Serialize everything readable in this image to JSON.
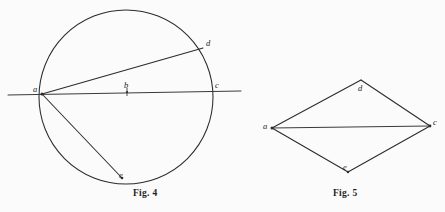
{
  "page": {
    "background_color": "#fbfbfb",
    "ink_color": "#2b2b2b",
    "width": 445,
    "height": 212
  },
  "figures": [
    {
      "id": "fig-4",
      "caption": "Fig. 4",
      "caption_pos": {
        "x": 133,
        "y": 189
      },
      "type": "circle-with-secant-and-chords",
      "circle": {
        "cx": 126,
        "cy": 97,
        "r": 87
      },
      "secant_line": {
        "x1": 8,
        "y1": 95,
        "x2": 241,
        "y2": 91
      },
      "chords": [
        {
          "from": "a",
          "to": "d"
        },
        {
          "from": "a",
          "to": "e"
        }
      ],
      "points": [
        {
          "name": "a",
          "x": 42,
          "y": 94,
          "label": "a",
          "label_x": 33,
          "label_y": 85,
          "dot": true
        },
        {
          "name": "b",
          "x": 127,
          "y": 92,
          "label": "b",
          "label_x": 124,
          "label_y": 81,
          "dot": true,
          "tick": true
        },
        {
          "name": "c",
          "x": 212,
          "y": 92,
          "label": "c",
          "label_x": 215,
          "label_y": 81,
          "dot": false
        },
        {
          "name": "d",
          "x": 203,
          "y": 48,
          "label": "d",
          "label_x": 206,
          "label_y": 39,
          "dot": false
        },
        {
          "name": "e",
          "x": 122,
          "y": 178,
          "label": "e",
          "label_x": 119,
          "label_y": 171,
          "dot": true
        }
      ]
    },
    {
      "id": "fig-5",
      "caption": "Fig. 5",
      "caption_pos": {
        "x": 333,
        "y": 189
      },
      "type": "quadrilateral-with-diagonal",
      "vertices": [
        {
          "name": "a",
          "x": 272,
          "y": 128,
          "label": "a",
          "label_x": 263,
          "label_y": 122,
          "dot": true
        },
        {
          "name": "d",
          "x": 361,
          "y": 80,
          "label": "d",
          "label_x": 358,
          "label_y": 84,
          "dot": false
        },
        {
          "name": "c",
          "x": 430,
          "y": 126,
          "label": "c",
          "label_x": 433,
          "label_y": 118,
          "dot": true
        },
        {
          "name": "e",
          "x": 348,
          "y": 172,
          "label": "e",
          "label_x": 343,
          "label_y": 163,
          "dot": true
        }
      ],
      "edges": [
        {
          "from": "a",
          "to": "d"
        },
        {
          "from": "d",
          "to": "c"
        },
        {
          "from": "c",
          "to": "e"
        },
        {
          "from": "e",
          "to": "a"
        }
      ],
      "diagonal": {
        "from": "a",
        "to": "c"
      }
    }
  ]
}
